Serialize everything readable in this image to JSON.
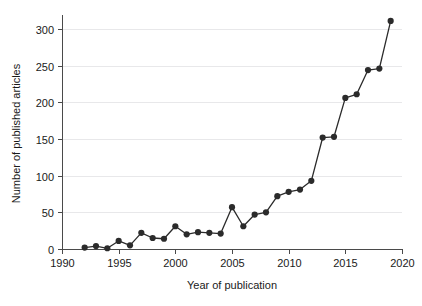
{
  "chart_data": {
    "type": "line",
    "title": "",
    "xlabel": "Year of publication",
    "ylabel": "Number of published articles",
    "xlim": [
      1990,
      2020
    ],
    "ylim": [
      0,
      315
    ],
    "grid": "horizontal",
    "legend": "none",
    "marker": "filled-circle",
    "line_color": "#2b2b2b",
    "grid_color": "#e8e8ea",
    "axis_color": "#4a4a4a",
    "xticks": [
      1990,
      1995,
      2000,
      2005,
      2010,
      2015,
      2020
    ],
    "xtick_labels": [
      "1990",
      "1995",
      "2000",
      "2005",
      "2010",
      "2015",
      "2020"
    ],
    "yticks": [
      0,
      50,
      100,
      150,
      200,
      250,
      300
    ],
    "ytick_labels": [
      "0",
      "50",
      "100",
      "150",
      "200",
      "250",
      "300"
    ],
    "x": [
      1992,
      1993,
      1994,
      1995,
      1996,
      1997,
      1998,
      1999,
      2000,
      2001,
      2002,
      2003,
      2004,
      2005,
      2006,
      2007,
      2008,
      2009,
      2010,
      2011,
      2012,
      2013,
      2014,
      2015,
      2016,
      2017,
      2018,
      2019
    ],
    "values": [
      2,
      4,
      1,
      11,
      5,
      22,
      15,
      14,
      31,
      20,
      23,
      22,
      21,
      57,
      31,
      47,
      50,
      72,
      78,
      81,
      93,
      152,
      153,
      206,
      211,
      244,
      246,
      311
    ],
    "series": [
      {
        "name": "Published articles",
        "values": [
          2,
          4,
          1,
          11,
          5,
          22,
          15,
          14,
          31,
          20,
          23,
          22,
          21,
          57,
          31,
          47,
          50,
          72,
          78,
          81,
          93,
          152,
          153,
          206,
          211,
          244,
          246,
          311
        ]
      }
    ]
  }
}
